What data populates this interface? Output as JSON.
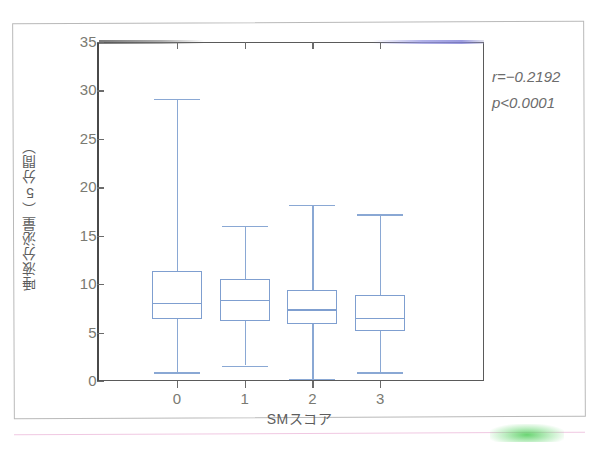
{
  "figure": {
    "background_color": "#ffffff",
    "frame_color": "#b9b9b9",
    "box_color": "#7f9fd0",
    "whisker_color": "#8aa8d4",
    "axis_color": "#5a5a5a",
    "tick_label_color": "#7a7a72"
  },
  "annotation": {
    "correlation_symbol": "r",
    "correlation_text": "r=−0.2192",
    "pvalue_text": "p<0.0001"
  },
  "chart_data": {
    "type": "box",
    "title": "",
    "subtitle": "",
    "xlabel": "SMスコア",
    "ylabel": "唾液分泌量（5分間）",
    "categories": [
      "0",
      "1",
      "2",
      "3"
    ],
    "xtick_labels": [
      "0",
      "1",
      "2",
      "3"
    ],
    "ytick_labels": [
      "0",
      "5",
      "10",
      "15",
      "20",
      "25",
      "30",
      "35"
    ],
    "yticks": [
      0,
      5,
      10,
      15,
      20,
      25,
      30,
      35
    ],
    "ylim": [
      0,
      35
    ],
    "grid": false,
    "legend": "none",
    "annotations": [
      "r=−0.2192",
      "p<0.0001"
    ],
    "boxes": [
      {
        "category": "0",
        "whisker_low": 0.9,
        "q1": 6.4,
        "median": 8.1,
        "q3": 11.4,
        "whisker_high": 29.1
      },
      {
        "category": "1",
        "whisker_low": 1.6,
        "q1": 6.2,
        "median": 8.4,
        "q3": 10.5,
        "whisker_high": 16.0
      },
      {
        "category": "2",
        "whisker_low": 0.2,
        "q1": 5.9,
        "median": 7.4,
        "q3": 9.4,
        "whisker_high": 18.2
      },
      {
        "category": "3",
        "whisker_low": 0.9,
        "q1": 5.2,
        "median": 6.5,
        "q3": 8.9,
        "whisker_high": 17.2
      }
    ]
  }
}
